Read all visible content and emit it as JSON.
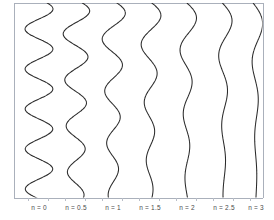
{
  "figure": {
    "background_color": "#ffffff",
    "frame_color": "#aab0bb",
    "curve_color": "#2b2b2b",
    "label_color": "#4a4a4a",
    "tick_color": "#b9bec8"
  },
  "chart_data": {
    "type": "line",
    "title": "",
    "xlabel": "",
    "ylabel": "",
    "orientation": "vertical",
    "grid": false,
    "legend_position": "bottom-inline",
    "axis": {
      "x_frame_left_px": 14,
      "x_frame_right_px": 263,
      "y_frame_top_px": 3,
      "y_frame_bottom_px": 198,
      "ticks_visible": true,
      "tick_side": "bottom"
    },
    "series": [
      {
        "name": "n = 0",
        "label": "n = 0",
        "order": 0,
        "baseline_x": 39,
        "amplitude": 14,
        "damping": 0.02,
        "wavelength": 40,
        "phase": 0.2,
        "tail_straight": false
      },
      {
        "name": "n = 0.5",
        "label": "n = 0.5",
        "order": 0.5,
        "baseline_x": 76,
        "amplitude": 14,
        "damping": 0.45,
        "wavelength": 46,
        "phase": 0.15,
        "tail_straight": true
      },
      {
        "name": "n = 1",
        "label": "n = 1",
        "order": 1,
        "baseline_x": 113,
        "amplitude": 13,
        "damping": 0.8,
        "wavelength": 52,
        "phase": 0.1,
        "tail_straight": true
      },
      {
        "name": "n = 1.5",
        "label": "n = 1.5",
        "order": 1.5,
        "baseline_x": 150,
        "amplitude": 12,
        "damping": 1.15,
        "wavelength": 58,
        "phase": 0.05,
        "tail_straight": true
      },
      {
        "name": "n = 2",
        "label": "n = 2",
        "order": 2,
        "baseline_x": 187,
        "amplitude": 11,
        "damping": 1.5,
        "wavelength": 64,
        "phase": 0.0,
        "tail_straight": true
      },
      {
        "name": "n = 2.5",
        "label": "n = 2.5",
        "order": 2.5,
        "baseline_x": 224,
        "amplitude": 10,
        "damping": 1.85,
        "wavelength": 70,
        "phase": -0.05,
        "tail_straight": true
      },
      {
        "name": "n = 3",
        "label": "n = 3",
        "order": 3,
        "baseline_x": 256,
        "amplitude": 9,
        "damping": 2.2,
        "wavelength": 76,
        "phase": -0.1,
        "tail_straight": true
      }
    ],
    "tick_positions_px": [
      28,
      48,
      65,
      85,
      102,
      122,
      139,
      159,
      176,
      196,
      213,
      233,
      250
    ]
  },
  "labels": [
    {
      "text": "n = 0",
      "x": 39,
      "y": 205
    },
    {
      "text": "n = 0.5",
      "x": 76,
      "y": 205
    },
    {
      "text": "n = 1",
      "x": 113,
      "y": 205
    },
    {
      "text": "n = 1.5",
      "x": 150,
      "y": 205
    },
    {
      "text": "n = 2",
      "x": 187,
      "y": 205
    },
    {
      "text": "n = 2.5",
      "x": 224,
      "y": 205
    },
    {
      "text": "n = 3",
      "x": 256,
      "y": 205
    }
  ]
}
